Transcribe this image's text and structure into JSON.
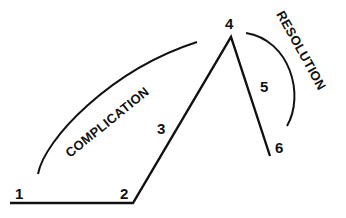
{
  "diagram": {
    "type": "plot-structure",
    "points": [
      {
        "id": "1",
        "label": "1"
      },
      {
        "id": "2",
        "label": "2"
      },
      {
        "id": "3",
        "label": "3"
      },
      {
        "id": "4",
        "label": "4"
      },
      {
        "id": "5",
        "label": "5"
      },
      {
        "id": "6",
        "label": "6"
      }
    ],
    "arcs": {
      "complication": "COMPLICATION",
      "resolution": "RESOLUTION"
    },
    "colors": {
      "line": "#111111",
      "background": "#ffffff"
    }
  }
}
